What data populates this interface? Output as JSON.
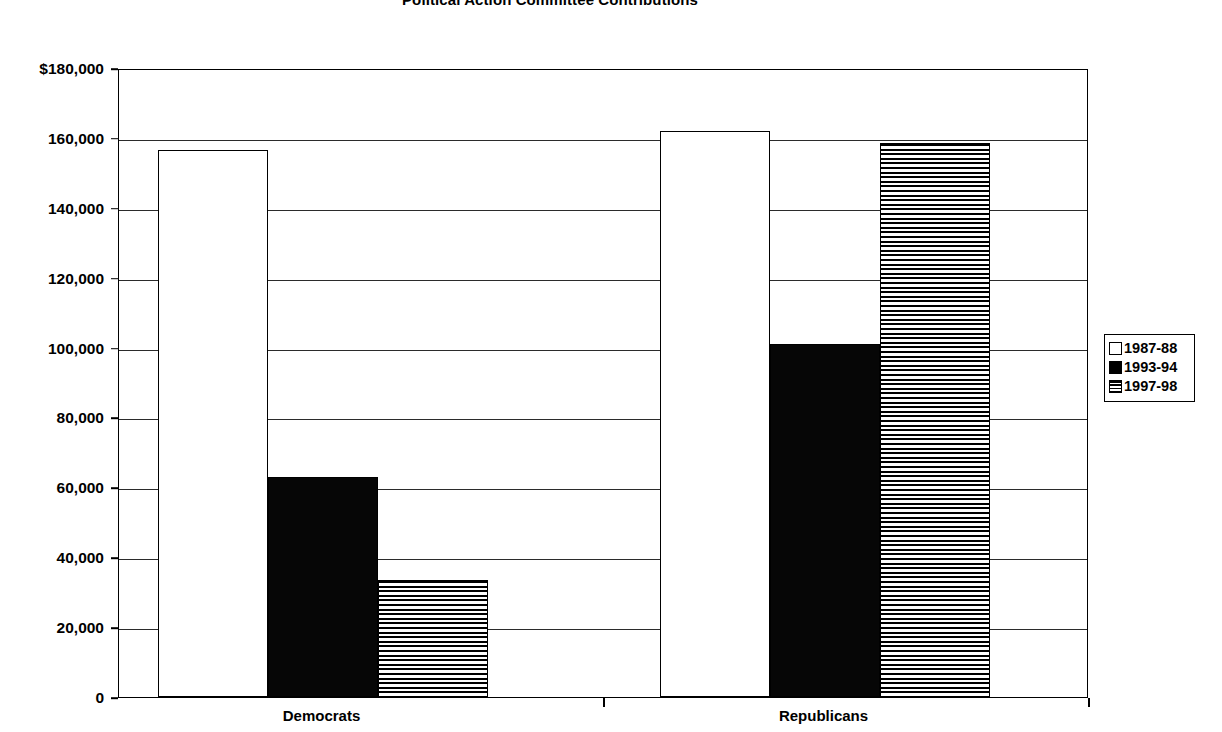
{
  "chart_data": {
    "type": "bar",
    "title": "Political Action Committee Contributions",
    "xlabel": "",
    "ylabel": "",
    "ylim": [
      0,
      180000
    ],
    "ytick_step": 20000,
    "ytick_labels": [
      "$180,000",
      "160,000",
      "140,000",
      "120,000",
      "100,000",
      "80,000",
      "60,000",
      "40,000",
      "20,000",
      "0"
    ],
    "ytick_values": [
      180000,
      160000,
      140000,
      120000,
      100000,
      80000,
      60000,
      40000,
      20000,
      0
    ],
    "grid": true,
    "legend_position": "right",
    "categories": [
      "Democrats",
      "Republicans"
    ],
    "series": [
      {
        "name": "1987-88",
        "fill": "open",
        "values": [
          156500,
          162000
        ]
      },
      {
        "name": "1993-94",
        "fill": "solid",
        "values": [
          63000,
          101000
        ]
      },
      {
        "name": "1997-98",
        "fill": "striped",
        "values": [
          33500,
          158500
        ]
      }
    ]
  }
}
